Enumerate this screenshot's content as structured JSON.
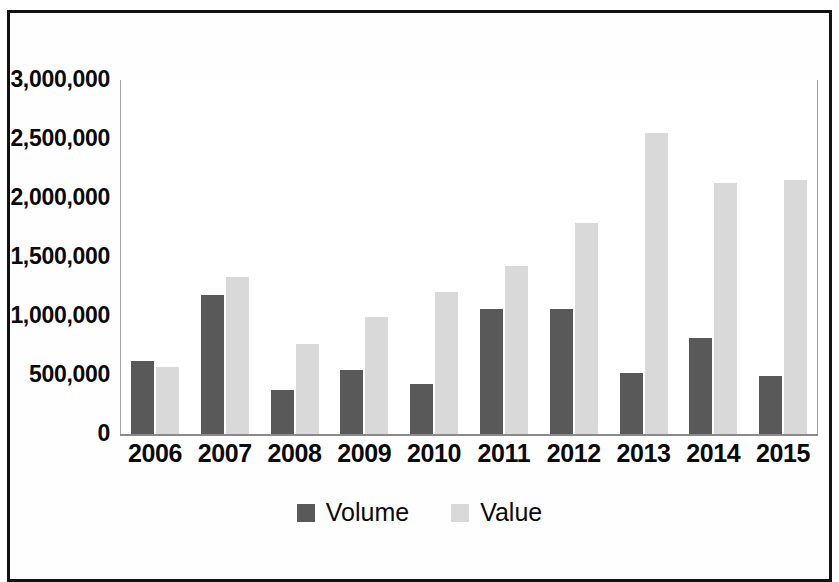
{
  "chart_data": {
    "type": "bar",
    "title": "",
    "subtitle": "",
    "xlabel": "",
    "ylabel": "",
    "categories": [
      "2006",
      "2007",
      "2008",
      "2009",
      "2010",
      "2011",
      "2012",
      "2013",
      "2014",
      "2015"
    ],
    "series": [
      {
        "name": "Volume",
        "color": "#595959",
        "values": [
          620000,
          1175000,
          375000,
          540000,
          425000,
          1060000,
          1060000,
          520000,
          815000,
          495000
        ]
      },
      {
        "name": "Value",
        "color": "#d9d9d9",
        "values": [
          570000,
          1330000,
          760000,
          990000,
          1200000,
          1420000,
          1785000,
          2555000,
          2130000,
          2150000
        ]
      }
    ],
    "ylim": [
      0,
      3000000
    ],
    "ytick_values": [
      0,
      500000,
      1000000,
      1500000,
      2000000,
      2500000,
      3000000
    ],
    "ytick_labels": [
      "0",
      "500,000",
      "1,000,000",
      "1,500,000",
      "2,000,000",
      "2,500,000",
      "3,000,000"
    ],
    "grid": true,
    "legend_position": "bottom",
    "legend": [
      "Volume",
      "Value"
    ]
  },
  "legend": {
    "entries": [
      {
        "label": "Volume"
      },
      {
        "label": "Value"
      }
    ]
  },
  "frame": {
    "border_color": "#111111",
    "background_color": "#ffffff"
  }
}
